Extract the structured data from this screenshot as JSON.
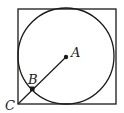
{
  "diagram": {
    "square": {
      "x": 18,
      "y": 9,
      "size": 98
    },
    "circle": {
      "cx": 66,
      "cy": 57,
      "r": 48
    },
    "points": {
      "A": {
        "label": "A",
        "x": 66,
        "y": 57
      },
      "B": {
        "label": "B",
        "x": 32,
        "y": 89
      },
      "C": {
        "label": "C",
        "x": 18,
        "y": 104
      }
    },
    "stroke_color": "#1a1a1a"
  }
}
